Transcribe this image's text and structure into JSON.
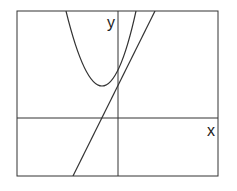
{
  "diagram": {
    "title": "",
    "x_axis_label": "x",
    "y_axis_label": "y",
    "elements": [
      {
        "type": "parabola",
        "description": "upward-opening parabola, vertex left of y-axis, above x-axis",
        "vertex_px": [
          103,
          86
        ]
      },
      {
        "type": "line",
        "description": "straight line with positive slope, crossing y-axis below the parabola's y-intercept",
        "from_px": [
          73,
          176
        ],
        "to_px": [
          155,
          11
        ]
      }
    ],
    "colors": {
      "stroke": "#222222",
      "background": "#ffffff"
    }
  }
}
